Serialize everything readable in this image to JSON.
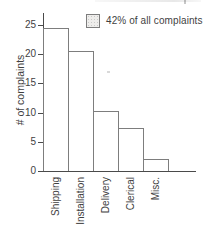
{
  "chart_data": {
    "type": "bar",
    "title": "",
    "xlabel": "",
    "ylabel": "# of complaints",
    "categories": [
      "Shipping",
      "Installation",
      "Delivery",
      "Clerical",
      "Misc."
    ],
    "values": [
      24.5,
      20.5,
      10.3,
      7.4,
      2
    ],
    "ylim": [
      0,
      25
    ],
    "yticks": [
      0,
      5,
      10,
      15,
      20,
      25
    ],
    "grid": false,
    "legend": {
      "text": "42% of all complaints",
      "position": "top-right",
      "swatch_style": "stippled"
    },
    "highlight": {
      "category": "Shipping",
      "style": "stippled-fill"
    },
    "colors": {
      "bar_fill": "#ffffff",
      "bar_fill_highlight": "#eeedeb",
      "bar_stipple_dot": "#c9c9c9",
      "bar_stroke": "#7d7d7d",
      "axis": "#4a4a4a",
      "text": "#3f3f3f",
      "background": "#ffffff"
    }
  }
}
